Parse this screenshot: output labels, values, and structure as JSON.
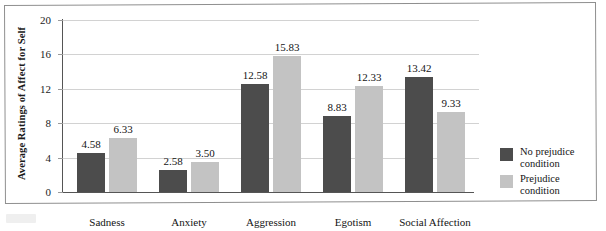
{
  "chart_data": {
    "type": "bar",
    "title": "",
    "xlabel": "",
    "ylabel": "Average Ratings of Affect for Self",
    "ylim": [
      0,
      20
    ],
    "yticks": [
      0,
      4,
      8,
      12,
      16,
      20
    ],
    "grid": true,
    "legend_position": "right",
    "categories": [
      "Sadness",
      "Anxiety",
      "Aggression",
      "Egotism",
      "Social Affection"
    ],
    "series": [
      {
        "name": "No prejudice condition",
        "color": "#4c4c4c",
        "values": [
          4.58,
          2.58,
          12.58,
          8.83,
          13.42
        ],
        "labels": [
          "4.58",
          "2.58",
          "12.58",
          "8.83",
          "13.42"
        ]
      },
      {
        "name": "Prejudice condition",
        "color": "#c3c3c3",
        "values": [
          6.33,
          3.5,
          15.83,
          12.33,
          9.33
        ],
        "labels": [
          "6.33",
          "3.50",
          "15.83",
          "12.33",
          "9.33"
        ]
      }
    ]
  },
  "axis": {
    "y_tick_labels": [
      "20",
      "16",
      "12",
      "8",
      "4",
      "0"
    ],
    "y_title": "Average Ratings of Affect for Self"
  },
  "legend": {
    "items": [
      {
        "label_line1": "No prejudice",
        "label_line2": "condition",
        "swatch": "dark-swatch-icon"
      },
      {
        "label_line1": "Prejudice",
        "label_line2": "condition",
        "swatch": "light-swatch-icon"
      }
    ]
  }
}
